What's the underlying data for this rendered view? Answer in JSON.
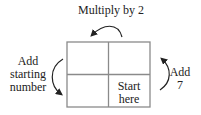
{
  "diagram": {
    "grid": {
      "rows": 2,
      "cols": 2,
      "stroke": "#8a8a8a"
    },
    "arrows": [
      {
        "id": "top",
        "label": "Multiply by 2",
        "direction": "right-to-left, over top"
      },
      {
        "id": "left",
        "label_lines": [
          "Add",
          "starting",
          "number"
        ],
        "direction": "top-to-bottom, left side"
      },
      {
        "id": "right",
        "label_lines": [
          "Add",
          "7"
        ],
        "direction": "bottom-to-top, right side"
      }
    ],
    "cells": {
      "bottom_right": {
        "label_lines": [
          "Start",
          "here"
        ]
      }
    }
  }
}
